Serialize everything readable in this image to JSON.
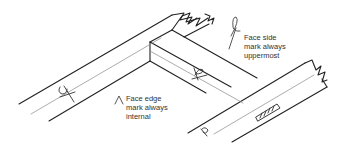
{
  "diagram": {
    "type": "woodworking-frame-joint",
    "colors": {
      "line": "#222222",
      "centerline": "#888888",
      "text": "#333333",
      "background": "#ffffff"
    },
    "annotations": [
      {
        "id": "face-side",
        "icon": "face-side-mark-icon",
        "lines": [
          "Face side",
          "mark always",
          "uppermost"
        ]
      },
      {
        "id": "face-edge",
        "icon": "face-edge-mark-icon",
        "lines": [
          "Face edge",
          "mark always",
          "internal"
        ]
      }
    ]
  }
}
